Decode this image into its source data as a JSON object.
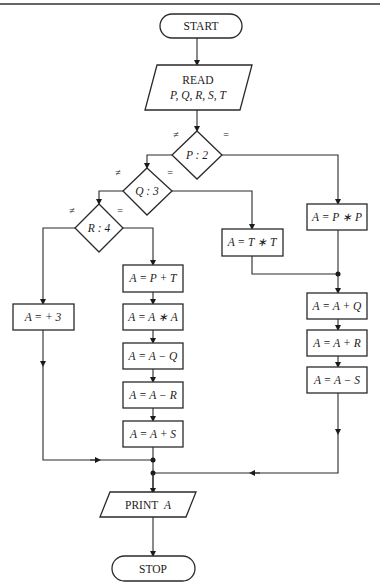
{
  "diagram": {
    "type": "flowchart",
    "terminals": {
      "start": "START",
      "stop": "STOP"
    },
    "io": {
      "read_title": "READ",
      "read_vars": "P, Q, R, S, T",
      "print_word": "PRINT",
      "print_var": "A"
    },
    "decisions": [
      {
        "id": "d1",
        "label": "P : 2",
        "ne_label": "≠",
        "eq_label": "="
      },
      {
        "id": "d2",
        "label": "Q : 3",
        "ne_label": "≠",
        "eq_label": "="
      },
      {
        "id": "d3",
        "label": "R : 4",
        "ne_label": "≠",
        "eq_label": "="
      }
    ],
    "processes": {
      "p_pp": "A = P ∗ P",
      "p_tt": "A = T ∗ T",
      "p_plus3": "A = + 3",
      "p_pt": "A = P + T",
      "p_aa": "A = A ∗ A",
      "p_amq": "A = A − Q",
      "p_amr": "A = A − R",
      "p_aps": "A = A + S",
      "p_apq": "A = A + Q",
      "p_apr": "A = A + R",
      "p_ams": "A = A − S"
    }
  }
}
